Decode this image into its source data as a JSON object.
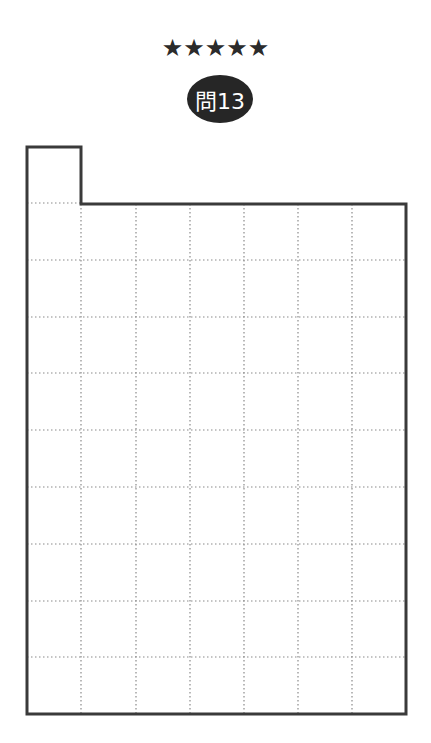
{
  "header": {
    "difficulty_stars": "★★★★★",
    "difficulty_level": 5,
    "problem_label": "問13"
  },
  "grid": {
    "columns": 7,
    "rows": 9,
    "notch": {
      "column": 0,
      "rows_above": 1
    },
    "line_color": "#3a3a3a",
    "dot_color": "#8a8a8a"
  }
}
